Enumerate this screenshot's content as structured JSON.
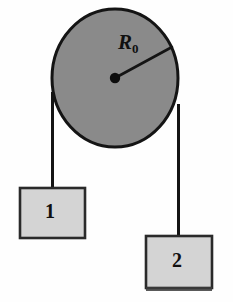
{
  "figure": {
    "background_color": "#fefefe",
    "pulley": {
      "label": "R",
      "label_subscript": "0",
      "fill_color": "#8a8a8a",
      "stroke_color": "#141414",
      "center_x": 115,
      "center_y": 78,
      "radius_x": 63,
      "radius_y": 69,
      "radius_line_end_x": 172,
      "radius_line_end_y": 47,
      "hub_dot_radius": 5
    },
    "blocks": [
      {
        "name": "block-1",
        "label": "1",
        "fill_color": "#d4d4d4",
        "stroke_color": "#2a2a2a",
        "x": 20,
        "y": 188,
        "width": 65,
        "height": 50
      },
      {
        "name": "block-2",
        "label": "2",
        "fill_color": "#d4d4d4",
        "stroke_color": "#2a2a2a",
        "x": 146,
        "y": 236,
        "width": 66,
        "height": 52
      }
    ],
    "ropes": [
      {
        "name": "rope-left",
        "x": 52.5,
        "y_top": 92,
        "y_bottom": 189,
        "stroke_color": "#141414",
        "stroke_width": 3
      },
      {
        "name": "rope-right",
        "x": 178.5,
        "y_top": 104,
        "y_bottom": 237,
        "stroke_color": "#141414",
        "stroke_width": 3
      }
    ],
    "artifact": {
      "name": "scan-artifact-bar",
      "x": 146,
      "y": 287,
      "width": 66,
      "height": 4,
      "color": "#3c3c3c"
    }
  }
}
